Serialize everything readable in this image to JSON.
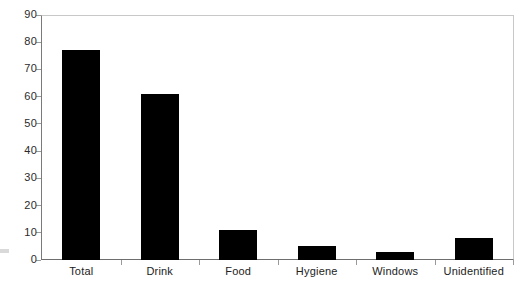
{
  "chart_data": {
    "type": "bar",
    "title": "",
    "subtitle": "",
    "xlabel": "",
    "ylabel": "",
    "categories": [
      "Total",
      "Drink",
      "Food",
      "Hygiene",
      "Windows",
      "Unidentified"
    ],
    "values": [
      77,
      61,
      11,
      5,
      3,
      8
    ],
    "ylim": [
      0,
      90
    ],
    "ytick_step": 10,
    "yticks": [
      0,
      10,
      20,
      30,
      40,
      50,
      60,
      70,
      80,
      90
    ],
    "ytick_labels": [
      "0",
      "10",
      "20",
      "30",
      "40",
      "50",
      "60",
      "70",
      "80",
      "90"
    ],
    "grid": false,
    "legend": false,
    "legend_position": "none",
    "bar_color": "#000000",
    "axis_color": "#6e6e6e",
    "plot_border_color": "#c8c8c8",
    "tick_label_color": "#2b2b2b",
    "background_color": "#ffffff"
  }
}
